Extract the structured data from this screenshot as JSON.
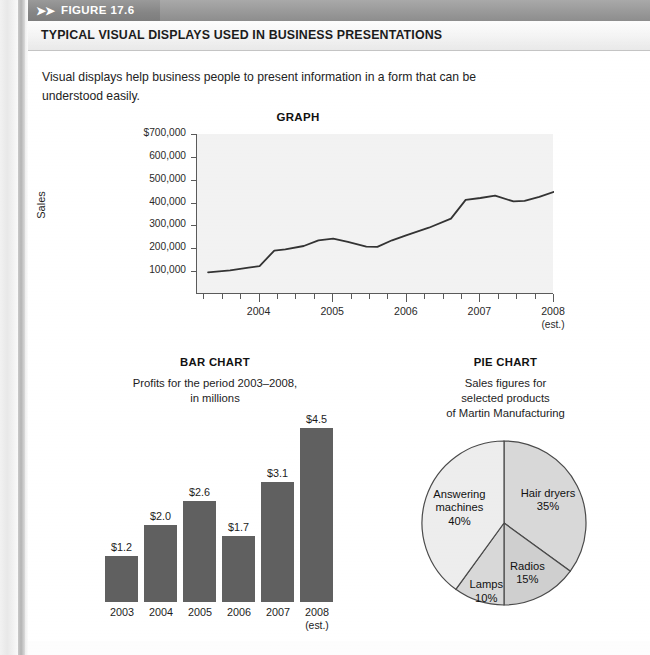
{
  "figure": {
    "tag_arrows": "➤➤",
    "tag_label": "FIGURE 17.6",
    "title": "TYPICAL VISUAL DISPLAYS USED IN BUSINESS PRESENTATIONS",
    "intro": "Visual displays help business people to present information in a form that can be understood easily."
  },
  "colors": {
    "header_band": "#989898",
    "tag_band": "#858585",
    "plot_background": "#f2f2f2",
    "axis": "#5a5a5a",
    "line": "#333333",
    "bar_fill": "#606060",
    "pie_light": "#ededed",
    "pie_mid": "#d8d8d8",
    "pie_dark": "#cfcfcf"
  },
  "chart_data": [
    {
      "type": "line",
      "title": "GRAPH",
      "xlabel": "",
      "ylabel": "Sales",
      "ylim": [
        0,
        700000
      ],
      "ytick_labels": [
        "$700,000",
        "600,000",
        "500,000",
        "400,000",
        "300,000",
        "200,000",
        "100,000"
      ],
      "ytick_values": [
        700000,
        600000,
        500000,
        400000,
        300000,
        200000,
        100000
      ],
      "xtick_labels": [
        "2004",
        "2005",
        "2006",
        "2007",
        "2008"
      ],
      "xtick_sub": [
        "",
        "",
        "",
        "",
        "(est.)"
      ],
      "grid": false,
      "legend": "none",
      "x": [
        2003.3,
        2003.6,
        2003.85,
        2004.0,
        2004.2,
        2004.35,
        2004.6,
        2004.8,
        2005.0,
        2005.2,
        2005.45,
        2005.6,
        2005.8,
        2006.0,
        2006.3,
        2006.6,
        2006.8,
        2007.0,
        2007.2,
        2007.45,
        2007.6,
        2007.8,
        2008.0
      ],
      "values": [
        95000,
        103000,
        115000,
        122000,
        190000,
        195000,
        210000,
        235000,
        242000,
        228000,
        207000,
        206000,
        235000,
        258000,
        290000,
        330000,
        412000,
        420000,
        430000,
        405000,
        407000,
        425000,
        447000
      ]
    },
    {
      "type": "bar",
      "title": "BAR CHART",
      "subtitle": "Profits for the period 2003–2008,\nin millions",
      "categories": [
        "2003",
        "2004",
        "2005",
        "2006",
        "2007",
        "2008"
      ],
      "category_sub": [
        "",
        "",
        "",
        "",
        "",
        "(est.)"
      ],
      "values": [
        1.2,
        2.0,
        2.6,
        1.7,
        3.1,
        4.5
      ],
      "value_labels": [
        "$1.2",
        "$2.0",
        "$2.6",
        "$1.7",
        "$3.1",
        "$4.5"
      ],
      "ylim": [
        0,
        4.5
      ],
      "xlabel": "",
      "ylabel": "",
      "grid": false,
      "legend": "none"
    },
    {
      "type": "pie",
      "title": "PIE CHART",
      "subtitle": "Sales figures for\nselected products\nof Martin Manufacturing",
      "labels": [
        "Hair dryers",
        "Radios",
        "Lamps",
        "Answering machines"
      ],
      "values": [
        35,
        15,
        10,
        40
      ],
      "percent_labels": [
        "35%",
        "15%",
        "10%",
        "40%"
      ],
      "start_angle_deg": 0,
      "direction": "clockwise",
      "legend": "none"
    }
  ]
}
